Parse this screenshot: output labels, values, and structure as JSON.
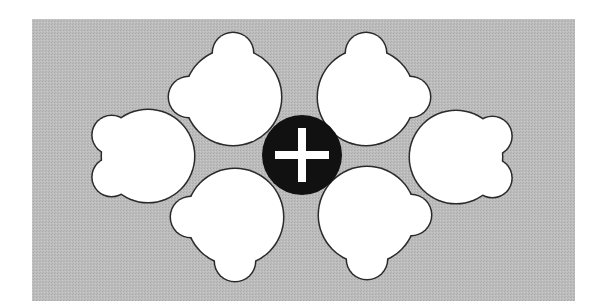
{
  "diagram": {
    "colors": {
      "page_background": "#ffffff",
      "panel_background": "#b9b9b9",
      "seat_fill": "#ffffff",
      "seat_outline": "#2a2a2a",
      "center_fill": "#111111",
      "center_icon": "#ffffff"
    },
    "center": {
      "icon": "plus-icon",
      "label": "add"
    },
    "seats": [
      {
        "id": "top-left",
        "facing": "upper-left"
      },
      {
        "id": "top-right",
        "facing": "upper-right"
      },
      {
        "id": "left",
        "facing": "left"
      },
      {
        "id": "right",
        "facing": "right"
      },
      {
        "id": "bottom-left",
        "facing": "lower-left"
      },
      {
        "id": "bottom-right",
        "facing": "lower-right"
      }
    ]
  }
}
